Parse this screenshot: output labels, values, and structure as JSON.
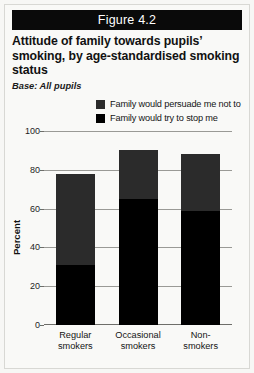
{
  "figure": {
    "header_label": "Figure 4.2",
    "title": "Attitude of family towards pupils’ smoking, by age-standardised smoking status",
    "base_note": "Base: All pupils"
  },
  "colors": {
    "header_background": "#0a0a0a",
    "segment_persuade": "#2b2b2b",
    "segment_stop": "#000000",
    "gridline": "#9a9a96",
    "card_background": "#f9f9f7"
  },
  "chart_data": {
    "type": "bar",
    "stacked": true,
    "title": "Attitude of family towards pupils’ smoking, by age-standardised smoking status",
    "xlabel": "",
    "ylabel": "Percent",
    "ylim": [
      0,
      100
    ],
    "yticks": [
      0,
      20,
      40,
      60,
      80,
      100
    ],
    "grid": true,
    "legend_position": "top-right",
    "categories": [
      "Regular smokers",
      "Occasional smokers",
      "Non-smokers"
    ],
    "category_lines": [
      [
        "Regular",
        "smokers"
      ],
      [
        "Occasional",
        "smokers"
      ],
      [
        "Non-",
        "smokers"
      ]
    ],
    "series": [
      {
        "name": "Family would try to stop me",
        "color": "#000000",
        "values": [
          31,
          65,
          59
        ]
      },
      {
        "name": "Family would persuade me not to",
        "color": "#2b2b2b",
        "values": [
          47,
          25,
          29
        ]
      }
    ],
    "totals": [
      78,
      90,
      88
    ]
  }
}
